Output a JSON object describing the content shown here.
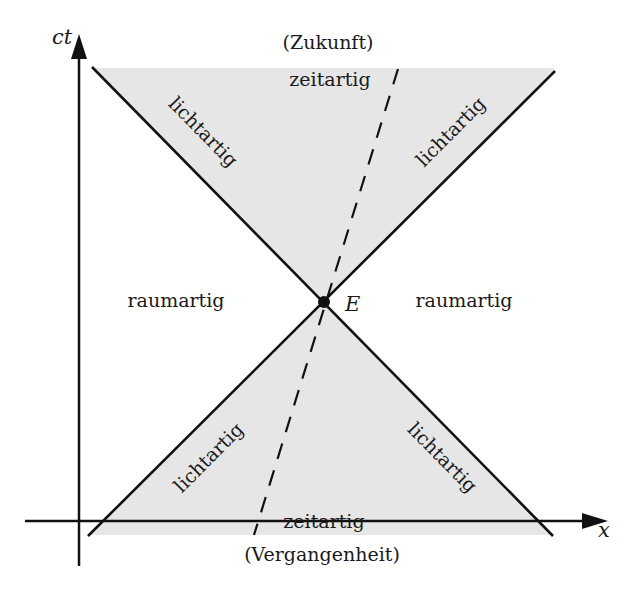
{
  "diagram": {
    "type": "spacetime-light-cone",
    "colors": {
      "background": "#ffffff",
      "cone_fill": "#e6e6e6",
      "line": "#111111"
    },
    "axes": {
      "vertical_label": "ct",
      "horizontal_label": "x"
    },
    "event": {
      "label": "E"
    },
    "regions": {
      "future_title": "(Zukunft)",
      "future_type": "zeitartig",
      "past_title": "(Vergangenheit)",
      "past_type": "zeitartig",
      "left_space": "raumartig",
      "right_space": "raumartig"
    },
    "light_lines": {
      "upper_left": "lichtartig",
      "upper_right": "lichtartig",
      "lower_left": "lichtartig",
      "lower_right": "lichtartig"
    },
    "worldline": {
      "style": "dashed"
    }
  }
}
